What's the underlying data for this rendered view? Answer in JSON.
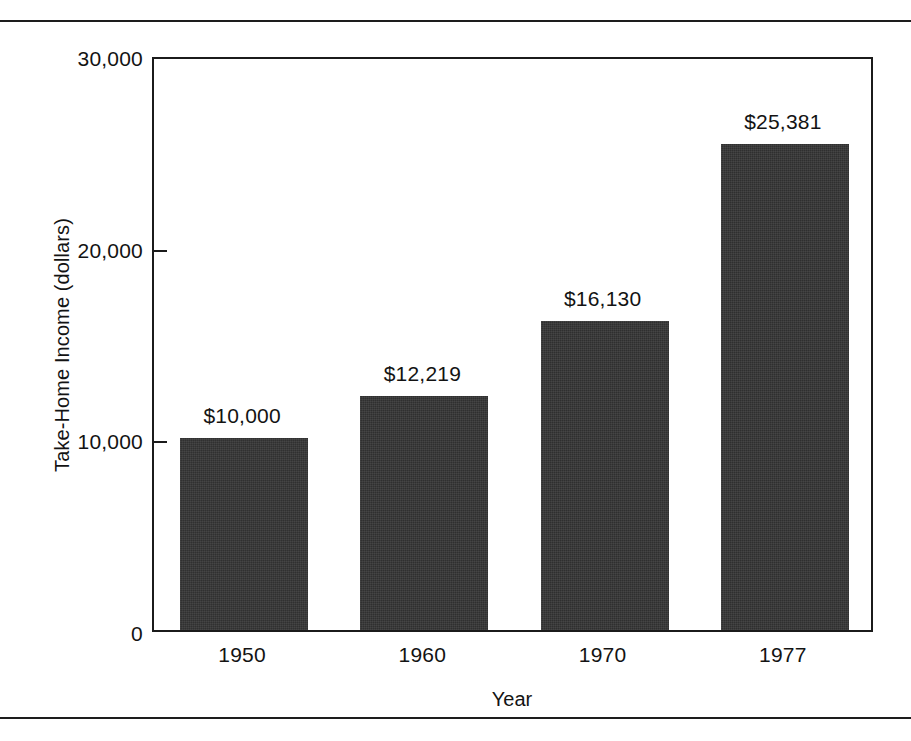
{
  "chart_data": {
    "type": "bar",
    "title": "",
    "xlabel": "Year",
    "ylabel": "Take-Home Income (dollars)",
    "categories": [
      "1950",
      "1960",
      "1970",
      "1977"
    ],
    "values": [
      10000,
      12219,
      16130,
      25381
    ],
    "value_labels": [
      "$10,000",
      "$12,219",
      "$16,130",
      "$25,381"
    ],
    "ylim": [
      0,
      30000
    ],
    "ytick_values": [
      0,
      10000,
      20000,
      30000
    ],
    "ytick_labels": [
      "0",
      "10,000",
      "20,000",
      "30,000"
    ],
    "grid": false,
    "legend": false,
    "bar_color": "#353535",
    "axis_color": "#1b1b1b",
    "background_color": "#ffffff",
    "tick_direction": "in",
    "ticks_shown_at": [
      "10,000",
      "20,000"
    ]
  }
}
